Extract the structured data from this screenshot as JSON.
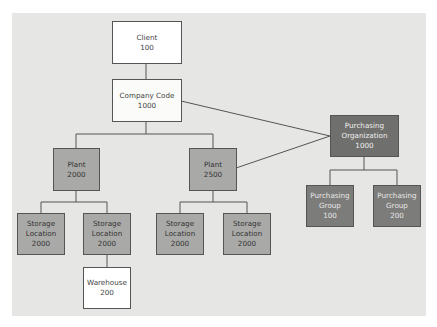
{
  "diagram": {
    "nodes": [
      {
        "id": "client",
        "title": "Client",
        "code": "100"
      },
      {
        "id": "company_code",
        "title": "Company Code",
        "code": "1000"
      },
      {
        "id": "plant_2000",
        "title": "Plant",
        "code": "2000"
      },
      {
        "id": "plant_2500",
        "title": "Plant",
        "code": "2500"
      },
      {
        "id": "purch_org",
        "title1": "Purchasing",
        "title2": "Organization",
        "code": "1000"
      },
      {
        "id": "purch_group_100",
        "title1": "Purchasing",
        "title2": "Group",
        "code": "100"
      },
      {
        "id": "purch_group_200",
        "title1": "Purchasing",
        "title2": "Group",
        "code": "200"
      },
      {
        "id": "sloc_1",
        "title1": "Storage",
        "title2": "Location",
        "code": "2000"
      },
      {
        "id": "sloc_2",
        "title1": "Storage",
        "title2": "Location",
        "code": "2000"
      },
      {
        "id": "sloc_3",
        "title1": "Storage",
        "title2": "Location",
        "code": "2000"
      },
      {
        "id": "sloc_4",
        "title1": "Storage",
        "title2": "Location",
        "code": "2000"
      },
      {
        "id": "warehouse",
        "title": "Warehouse",
        "code": "200"
      }
    ],
    "edges": [
      [
        "client",
        "company_code"
      ],
      [
        "company_code",
        "plant_2000"
      ],
      [
        "company_code",
        "plant_2500"
      ],
      [
        "company_code",
        "purch_org"
      ],
      [
        "plant_2500",
        "purch_org"
      ],
      [
        "purch_org",
        "purch_group_100"
      ],
      [
        "purch_org",
        "purch_group_200"
      ],
      [
        "plant_2000",
        "sloc_1"
      ],
      [
        "plant_2000",
        "sloc_2"
      ],
      [
        "plant_2500",
        "sloc_3"
      ],
      [
        "plant_2500",
        "sloc_4"
      ],
      [
        "sloc_2",
        "warehouse"
      ]
    ],
    "colors": {
      "background": "#e6e6e4",
      "white_box": "#ffffff",
      "plant_box": "#a9a9a7",
      "purchasing_org_box": "#6f6f6d",
      "purchasing_group_box": "#7c7c7a",
      "line": "#555555"
    }
  }
}
